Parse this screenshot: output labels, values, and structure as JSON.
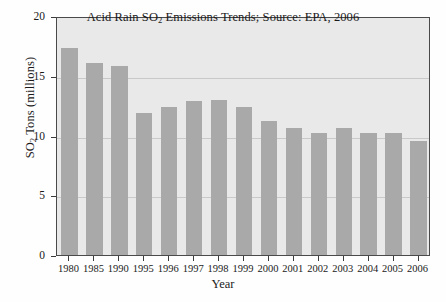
{
  "chart_data": {
    "type": "bar",
    "title": "Acid Rain SO2 Emissions Trends; Source: EPA, 2006",
    "title_parts": {
      "before_sub": "Acid Rain SO",
      "sub": "2",
      "after_sub": " Emissions Trends; Source: EPA, 2006"
    },
    "xlabel": "Year",
    "ylabel": "SO2 Tons (millions)",
    "ylabel_parts": {
      "before_sub": "SO",
      "sub": "2",
      "after_sub": " Tons (millions)"
    },
    "categories": [
      "1980",
      "1985",
      "1990",
      "1995",
      "1996",
      "1997",
      "1998",
      "1999",
      "2000",
      "2001",
      "2002",
      "2003",
      "2004",
      "2005",
      "2006"
    ],
    "values": [
      17.3,
      16.1,
      15.8,
      11.9,
      12.4,
      12.9,
      13.0,
      12.4,
      11.2,
      10.6,
      10.2,
      10.6,
      10.2,
      10.2,
      9.5
    ],
    "ylim": [
      0,
      20
    ],
    "yticks": [
      0,
      5,
      10,
      15,
      20
    ],
    "ytick_labels": [
      "0",
      "5",
      "10",
      "15",
      "20"
    ],
    "grid": true,
    "legend": null,
    "colors": {
      "bar_fill": "#a9a9a9",
      "plot_background": "#e9e9e9",
      "gridline": "#c9c9c9",
      "axis": "#4a4a4a",
      "text": "#1a1a1a",
      "figure_background": "#fefefe"
    }
  }
}
